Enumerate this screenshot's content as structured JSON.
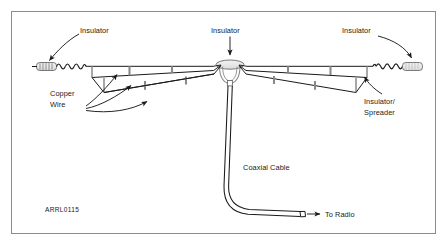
{
  "figure": {
    "id_code": "ARRL0115",
    "background_color": "#ffffff",
    "line_color": "#1a1a1a",
    "border_color": "#808080"
  },
  "labels": {
    "insulator_left": "Insulator",
    "insulator_center": "Insulator",
    "insulator_right": "Insulator",
    "copper_wire_line1": "Copper",
    "copper_wire_line2": "Wire",
    "insulator_spreader_line1": "Insulator/",
    "insulator_spreader_line2": "Spreader",
    "coaxial_cable": "Coaxial Cable",
    "to_radio": "To Radio"
  },
  "components": {
    "end_insulator_left": "hatched-egg-insulator",
    "end_insulator_right": "hatched-egg-insulator",
    "center_insulator": "teardrop-center-insulator",
    "coil_left": "coiled-wire-loop",
    "coil_right": "coiled-wire-loop",
    "spreaders_left_count": 3,
    "spreaders_right_count": 3,
    "feedline": "coaxial-cable",
    "feedline_terminator": "cable-end-connector"
  },
  "arrows": {
    "insulator_left_arrow": "arrow-to-left-end-insulator",
    "insulator_center_arrow": "arrow-to-center-insulator",
    "insulator_right_arrow": "arrow-to-right-end-insulator",
    "copper_wire_arrow_1": "arrow-to-upper-cage-wire",
    "copper_wire_arrow_2": "arrow-to-mid-cage-wire",
    "copper_wire_arrow_3": "arrow-to-lower-cage-wire",
    "spreader_arrow": "arrow-to-right-spreader",
    "to_radio_arrow": "arrow-to-radio"
  }
}
